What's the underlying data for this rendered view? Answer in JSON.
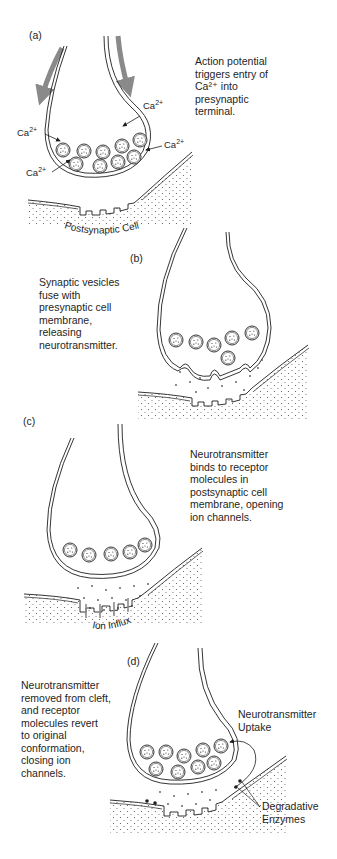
{
  "panels": [
    {
      "id": "a",
      "letter": "(a)",
      "description": "Action potential\ntriggers entry of\nCa²⁺ into\npresynaptic\nterminal.",
      "ion_labels": [
        "Ca",
        "Ca",
        "Ca",
        "Ca"
      ],
      "ion_charge": "2+",
      "cell_label": "Postsynaptic Cell"
    },
    {
      "id": "b",
      "letter": "(b)",
      "description": "Synaptic vesicles\nfuse with\npresynaptic  cell\nmembrane,\nreleasing\nneurotransmitter."
    },
    {
      "id": "c",
      "letter": "(c)",
      "description": "Neurotransmitter\nbinds to receptor\nmolecules in\npostsynaptic cell\nmembrane, opening\nion channels.",
      "flow_label": "Ion Influx"
    },
    {
      "id": "d",
      "letter": "(d)",
      "description": "Neurotransmitter\nremoved from cleft,\nand receptor\nmolecules revert\nto original\nconformation,\nclosing ion\nchannels.",
      "uptake_label": "Neurotransmitter\nUptake",
      "enzyme_label": "Degradative\nEnzymes"
    }
  ],
  "colors": {
    "ink": "#1e1e1e",
    "arrow": "#8a8a8a",
    "stipple": "#555555"
  }
}
